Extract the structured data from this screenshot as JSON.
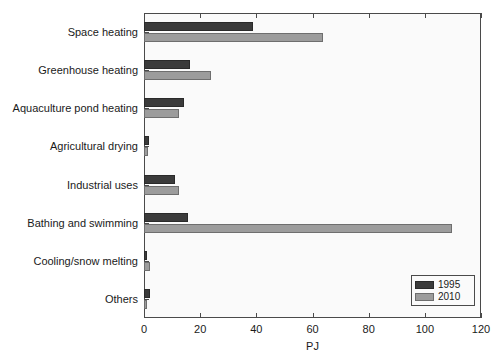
{
  "chart_data": {
    "type": "bar",
    "orientation": "horizontal",
    "title": "",
    "xlabel": "PJ",
    "ylabel": "",
    "xlim": [
      0,
      120
    ],
    "xticks": [
      "0",
      "20",
      "40",
      "60",
      "80",
      "100",
      "120"
    ],
    "grid": false,
    "legend_position": "bottom-right",
    "categories": [
      "Space heating",
      "Greenhouse heating",
      "Aquaculture pond heating",
      "Agricultural drying",
      "Industrial uses",
      "Bathing and swimming",
      "Cooling/snow melting",
      "Others"
    ],
    "series": [
      {
        "name": "1995",
        "color": "#3b3b3b",
        "values": [
          38.8,
          16.4,
          14.2,
          1.8,
          11.0,
          15.7,
          1.2,
          2.3
        ]
      },
      {
        "name": "2010",
        "color": "#9c9c9c",
        "values": [
          63.7,
          23.9,
          12.5,
          1.6,
          12.5,
          109.7,
          2.3,
          1.2
        ]
      }
    ]
  }
}
